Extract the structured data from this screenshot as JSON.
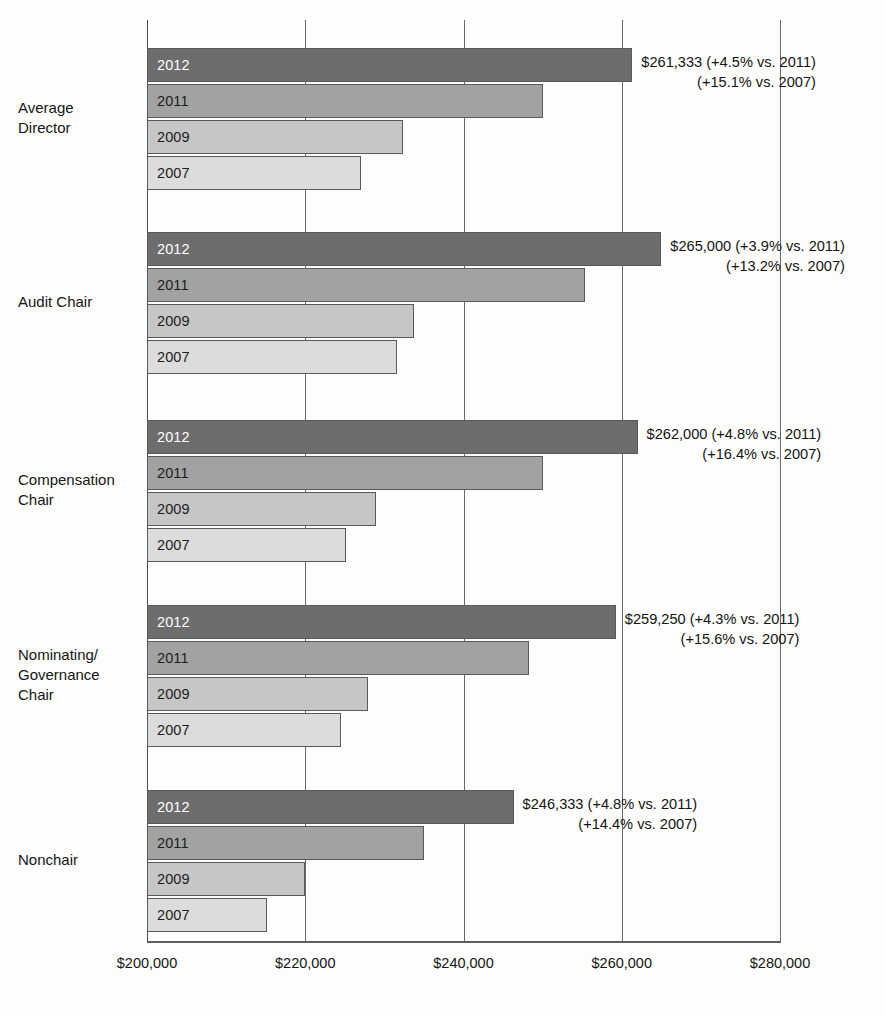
{
  "chart_data": {
    "type": "bar",
    "orientation": "horizontal",
    "title": "",
    "subtitle": "",
    "xlabel": "",
    "ylabel": "",
    "xlim": [
      200000,
      280000
    ],
    "xticks": [
      200000,
      220000,
      240000,
      260000,
      280000
    ],
    "xtick_labels": [
      "$200,000",
      "$220,000",
      "$240,000",
      "$260,000",
      "$280,000"
    ],
    "grid": "vertical",
    "legend": "none",
    "series_order": [
      "2012",
      "2011",
      "2009",
      "2007"
    ],
    "categories": [
      "Average Director",
      "Audit Chair",
      "Compensation Chair",
      "Nominating/ Governance Chair",
      "Nonchair"
    ],
    "series": [
      {
        "name": "2012",
        "values": [
          261333,
          265000,
          262000,
          259250,
          246333
        ]
      },
      {
        "name": "2011",
        "values": [
          250000,
          255300,
          250000,
          248300,
          235000
        ]
      },
      {
        "name": "2009",
        "values": [
          232400,
          233700,
          228900,
          227900,
          220000
        ]
      },
      {
        "name": "2007",
        "values": [
          227100,
          231600,
          225100,
          224500,
          215200
        ]
      }
    ],
    "colors": {
      "2012": "#6d6d6d",
      "2011": "#a2a2a2",
      "2009": "#c6c6c6",
      "2007": "#dcdcdc",
      "bar_border": "#59595a",
      "gridline": "#6a6a6a",
      "axis": "#5d5d5d",
      "text": "#141414",
      "bar_label_on_dark": "#ffffff",
      "background": "#fdfdfc"
    },
    "annotations": [
      {
        "category": "Average Director",
        "line1": "$261,333 (+4.5% vs. 2011)",
        "line2": "(+15.1% vs. 2007)"
      },
      {
        "category": "Audit Chair",
        "line1": "$265,000 (+3.9% vs. 2011)",
        "line2": "(+13.2% vs. 2007)"
      },
      {
        "category": "Compensation Chair",
        "line1": "$262,000 (+4.8% vs. 2011)",
        "line2": "(+16.4% vs. 2007)"
      },
      {
        "category": "Nominating/ Governance Chair",
        "line1": "$259,250 (+4.3% vs. 2011)",
        "line2": "(+15.6% vs. 2007)"
      },
      {
        "category": "Nonchair",
        "line1": "$246,333 (+4.8% vs. 2011)",
        "line2": "(+14.4% vs. 2007)"
      }
    ]
  },
  "groups": [
    {
      "label_line1": "Average",
      "label_line2": "Director",
      "label_line3": "",
      "bars": [
        {
          "year": "2012",
          "value": 261333
        },
        {
          "year": "2011",
          "value": 250000
        },
        {
          "year": "2009",
          "value": 232400
        },
        {
          "year": "2007",
          "value": 227100
        }
      ],
      "note_line1": "$261,333 (+4.5% vs. 2011)",
      "note_line2": "(+15.1% vs. 2007)"
    },
    {
      "label_line1": "Audit Chair",
      "label_line2": "",
      "label_line3": "",
      "bars": [
        {
          "year": "2012",
          "value": 265000
        },
        {
          "year": "2011",
          "value": 255300
        },
        {
          "year": "2009",
          "value": 233700
        },
        {
          "year": "2007",
          "value": 231600
        }
      ],
      "note_line1": "$265,000 (+3.9% vs. 2011)",
      "note_line2": "(+13.2% vs. 2007)"
    },
    {
      "label_line1": "Compensation",
      "label_line2": "Chair",
      "label_line3": "",
      "bars": [
        {
          "year": "2012",
          "value": 262000
        },
        {
          "year": "2011",
          "value": 250000
        },
        {
          "year": "2009",
          "value": 228900
        },
        {
          "year": "2007",
          "value": 225100
        }
      ],
      "note_line1": "$262,000 (+4.8% vs. 2011)",
      "note_line2": "(+16.4% vs. 2007)"
    },
    {
      "label_line1": "Nominating/",
      "label_line2": "Governance",
      "label_line3": "Chair",
      "bars": [
        {
          "year": "2012",
          "value": 259250
        },
        {
          "year": "2011",
          "value": 248300
        },
        {
          "year": "2009",
          "value": 227900
        },
        {
          "year": "2007",
          "value": 224500
        }
      ],
      "note_line1": "$259,250 (+4.3% vs. 2011)",
      "note_line2": "(+15.6% vs. 2007)"
    },
    {
      "label_line1": "Nonchair",
      "label_line2": "",
      "label_line3": "",
      "bars": [
        {
          "year": "2012",
          "value": 246333
        },
        {
          "year": "2011",
          "value": 235000
        },
        {
          "year": "2009",
          "value": 220000
        },
        {
          "year": "2007",
          "value": 215200
        }
      ],
      "note_line1": "$246,333 (+4.8% vs. 2011)",
      "note_line2": "(+14.4% vs. 2007)"
    }
  ]
}
